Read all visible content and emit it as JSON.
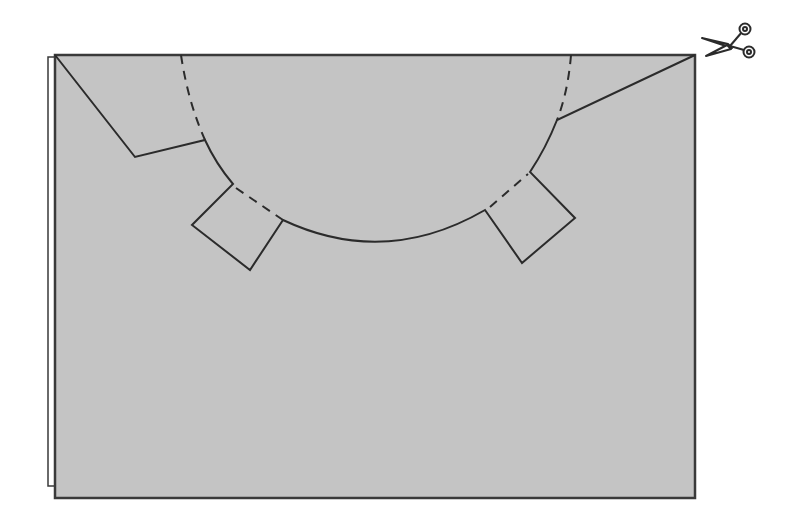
{
  "diagram": {
    "description": "Folded paper cutting template with a semicircular cut and two rectangular tabs",
    "colors": {
      "paper": "#c4c4c4",
      "back_sheet": "#ffffff",
      "line": "#2b2b2b",
      "border": "#3a3a3a",
      "background": "#ffffff"
    },
    "icons": {
      "scissors": "scissors-icon"
    },
    "sheet": {
      "x": 55,
      "y": 55,
      "width": 640,
      "height": 443
    },
    "back_sheet": {
      "x": 48,
      "y": 57,
      "bottom": 486
    },
    "cut_line_label": "cut line",
    "fold_line_label": "fold line"
  }
}
